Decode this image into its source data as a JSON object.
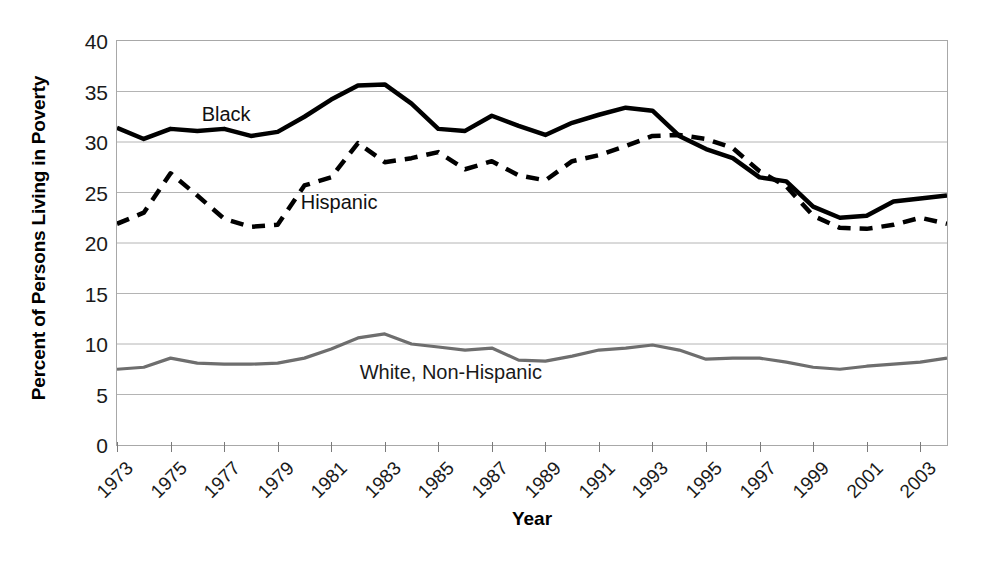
{
  "chart_data": {
    "type": "line",
    "title": "",
    "xlabel": "Year",
    "ylabel": "Percent of Persons Living in Poverty",
    "xlim": [
      1973,
      2004
    ],
    "ylim": [
      0,
      40
    ],
    "yticks": [
      0,
      5,
      10,
      15,
      20,
      25,
      30,
      35,
      40
    ],
    "xticks": [
      1973,
      1975,
      1977,
      1979,
      1981,
      1983,
      1985,
      1987,
      1989,
      1991,
      1993,
      1995,
      1997,
      1999,
      2001,
      2003
    ],
    "grid": "horizontal",
    "legend_position": "inline-labels",
    "x": [
      1973,
      1974,
      1975,
      1976,
      1977,
      1978,
      1979,
      1980,
      1981,
      1982,
      1983,
      1984,
      1985,
      1986,
      1987,
      1988,
      1989,
      1990,
      1991,
      1992,
      1993,
      1994,
      1995,
      1996,
      1997,
      1998,
      1999,
      2000,
      2001,
      2002,
      2003,
      2004
    ],
    "series": [
      {
        "name": "Black",
        "label": "Black",
        "color": "#000000",
        "style": "solid",
        "width": 4.5,
        "values": [
          31.4,
          30.3,
          31.3,
          31.1,
          31.3,
          30.6,
          31.0,
          32.5,
          34.2,
          35.6,
          35.7,
          33.8,
          31.3,
          31.1,
          32.6,
          31.6,
          30.7,
          31.9,
          32.7,
          33.4,
          33.1,
          30.6,
          29.3,
          28.4,
          26.5,
          26.1,
          23.6,
          22.5,
          22.7,
          24.1,
          24.4,
          24.7
        ]
      },
      {
        "name": "Hispanic",
        "label": "Hispanic",
        "color": "#000000",
        "style": "dashed",
        "width": 4.5,
        "values": [
          21.9,
          23.0,
          26.9,
          24.7,
          22.4,
          21.6,
          21.8,
          25.7,
          26.5,
          29.9,
          28.0,
          28.4,
          29.0,
          27.3,
          28.1,
          26.7,
          26.2,
          28.1,
          28.7,
          29.6,
          30.6,
          30.7,
          30.3,
          29.4,
          27.1,
          25.6,
          22.7,
          21.5,
          21.4,
          21.8,
          22.5,
          21.9
        ]
      },
      {
        "name": "White, Non-Hispanic",
        "label": "White, Non-Hispanic",
        "color": "#6e6e6e",
        "style": "solid",
        "width": 3.2,
        "values": [
          7.5,
          7.7,
          8.6,
          8.1,
          8.0,
          8.0,
          8.1,
          8.6,
          9.5,
          10.6,
          11.0,
          10.0,
          9.7,
          9.4,
          9.6,
          8.4,
          8.3,
          8.8,
          9.4,
          9.6,
          9.9,
          9.4,
          8.5,
          8.6,
          8.6,
          8.2,
          7.7,
          7.5,
          7.8,
          8.0,
          8.2,
          8.6
        ]
      }
    ]
  },
  "labels": {
    "black": "Black",
    "hispanic": "Hispanic",
    "white": "White, Non-Hispanic"
  },
  "axis": {
    "x_title": "Year",
    "y_title": "Percent of Persons Living in Poverty"
  }
}
